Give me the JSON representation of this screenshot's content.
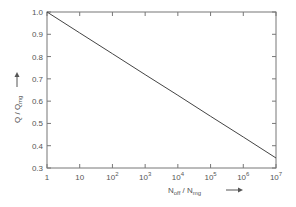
{
  "chart_data": {
    "type": "line",
    "title": "",
    "xlabel": "N_off / N_mg",
    "ylabel": "Q / Q_mg",
    "x_scale": "log",
    "xlim": [
      1,
      10000000
    ],
    "ylim": [
      0.3,
      1.0
    ],
    "grid": false,
    "legend": null,
    "x_tick_labels": [
      "1",
      "10",
      "10^2",
      "10^3",
      "10^4",
      "10^5",
      "10^6",
      "10^7"
    ],
    "y_tick_labels": [
      "0.3",
      "0.4",
      "0.5",
      "0.6",
      "0.7",
      "0.8",
      "0.9",
      "1.0"
    ],
    "series": [
      {
        "name": "Q/Q_mg",
        "x": [
          1,
          10,
          100,
          1000,
          10000,
          100000,
          1000000,
          10000000
        ],
        "values": [
          1.0,
          0.906,
          0.813,
          0.719,
          0.626,
          0.532,
          0.439,
          0.345
        ]
      }
    ]
  },
  "labels": {
    "x_axis": {
      "main": "N",
      "sub1": "off",
      "sep": " / N",
      "sub2": "mg"
    },
    "y_axis": {
      "main": "Q / Q",
      "sub": "mg"
    }
  },
  "colors": {
    "line": "#444444",
    "axis": "#666666",
    "text": "#555555"
  }
}
